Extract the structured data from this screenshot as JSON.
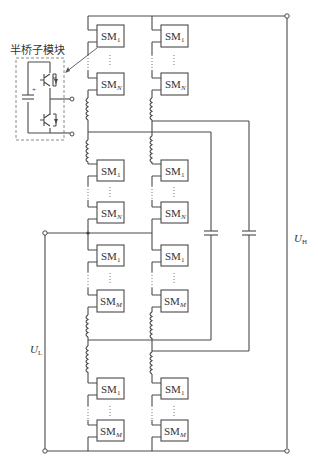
{
  "diagram": {
    "inset_label": "半桥子模块",
    "terminal_high": {
      "main": "U",
      "sub": "H"
    },
    "terminal_low": {
      "main": "U",
      "sub": "L"
    },
    "arms": [
      {
        "name": "upper-arm-1",
        "modules": [
          {
            "main": "SM",
            "sub": "1"
          },
          {
            "main": "SM",
            "sub": "N"
          }
        ]
      },
      {
        "name": "upper-arm-2",
        "modules": [
          {
            "main": "SM",
            "sub": "1"
          },
          {
            "main": "SM",
            "sub": "N"
          }
        ]
      },
      {
        "name": "lower-arm-1",
        "modules": [
          {
            "main": "SM",
            "sub": "1"
          },
          {
            "main": "SM",
            "sub": "M"
          }
        ]
      },
      {
        "name": "lower-arm-2",
        "modules": [
          {
            "main": "SM",
            "sub": "1"
          },
          {
            "main": "SM",
            "sub": "M"
          }
        ]
      }
    ],
    "ellipsis": "⋮",
    "capacitor_plus": "+"
  }
}
